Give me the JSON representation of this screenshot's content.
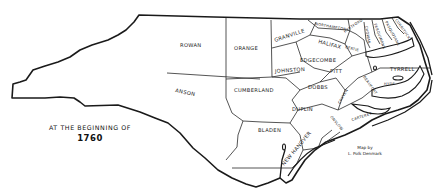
{
  "map": {
    "title": "AT THE BEGINNING OF",
    "year": "1760",
    "credit_line_1": "Map by",
    "credit_line_2": "L. Polk Denmark",
    "stroke_color": "#1a1a1a",
    "background_color": "#ffffff"
  },
  "counties": {
    "rowan": "ROWAN",
    "anson": "ANSON",
    "orange": "ORANGE",
    "granville": "GRANVILLE",
    "northampton": "NORTHAMPTON",
    "hertford": "HERTFORD",
    "halifax": "HALIFAX",
    "bertie": "BERTIE",
    "edgecombe": "EDGECOMBE",
    "johnston": "JOHNSTON",
    "pitt": "PITT",
    "cumberland": "CUMBERLAND",
    "dobbs": "DOBBS",
    "duplin": "DUPLIN",
    "bladen": "BLADEN",
    "new_hanover": "NEW HANOVER",
    "onslow": "ONSLOW",
    "carteret": "CARTERET",
    "craven": "CRAVEN",
    "beaufort": "BEAUFORT",
    "tyrrell": "TYRRELL",
    "hyde": "HYDE",
    "chowan": "CHOWAN",
    "perquimans": "PERQUIMANS",
    "pasquotank": "PASQUOTANK",
    "currituck": "CURRITUCK"
  }
}
